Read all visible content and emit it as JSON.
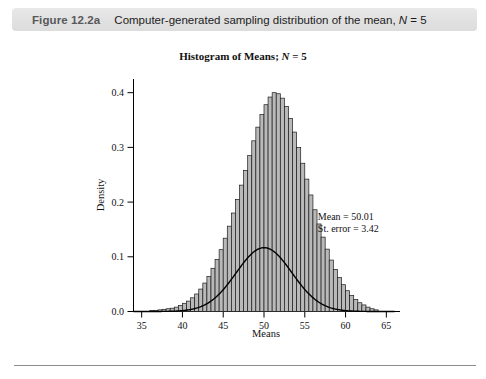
{
  "caption": {
    "label": "Figure 12.2a",
    "text_before_italic": "Computer-generated sampling distribution of the mean, ",
    "italic_symbol": "N",
    "text_after_italic": " = 5",
    "full": "Figure 12.2a   Computer-generated sampling distribution of the mean, N = 5",
    "background_color": "#e2e2e2",
    "label_color": "#58585a"
  },
  "chart_data": {
    "type": "bar",
    "title_prefix": "Histogram of Means; ",
    "title_italic": "N",
    "title_suffix": " = 5",
    "title": "Histogram of Means; N = 5",
    "xlabel": "Means",
    "ylabel": "Density",
    "xlim": [
      34.0,
      66.0
    ],
    "ylim": [
      0.0,
      0.425
    ],
    "xticks": [
      35,
      40,
      45,
      50,
      55,
      60,
      65
    ],
    "xtick_labels": [
      "35",
      "40",
      "45",
      "50",
      "55",
      "60",
      "65"
    ],
    "yticks": [
      0.0,
      0.1,
      0.2,
      0.3,
      0.4
    ],
    "ytick_labels": [
      "0.0",
      "0.1",
      "0.2",
      "0.3",
      "0.4"
    ],
    "grid": false,
    "legend": "none",
    "bar_fill_color": "#b9b9b9",
    "bar_edge_color": "#1a1a1a",
    "curve_color": "#000000",
    "bin_width": 0.5,
    "bin_centers": [
      36.25,
      36.75,
      37.25,
      37.75,
      38.25,
      38.75,
      39.25,
      39.75,
      40.25,
      40.75,
      41.25,
      41.75,
      42.25,
      42.75,
      43.25,
      43.75,
      44.25,
      44.75,
      45.25,
      45.75,
      46.25,
      46.75,
      47.25,
      47.75,
      48.25,
      48.75,
      49.25,
      49.75,
      50.25,
      50.75,
      51.25,
      51.75,
      52.25,
      52.75,
      53.25,
      53.75,
      54.25,
      54.75,
      55.25,
      55.75,
      56.25,
      56.75,
      57.25,
      57.75,
      58.25,
      58.75,
      59.25,
      59.75,
      60.25,
      60.75,
      61.25,
      61.75,
      62.25,
      62.75,
      63.25,
      63.75
    ],
    "values": [
      0.002,
      0.002,
      0.003,
      0.004,
      0.005,
      0.006,
      0.008,
      0.011,
      0.015,
      0.019,
      0.025,
      0.032,
      0.041,
      0.052,
      0.064,
      0.079,
      0.095,
      0.113,
      0.134,
      0.156,
      0.18,
      0.205,
      0.231,
      0.258,
      0.285,
      0.312,
      0.337,
      0.36,
      0.378,
      0.392,
      0.4,
      0.398,
      0.39,
      0.375,
      0.353,
      0.328,
      0.3,
      0.271,
      0.242,
      0.213,
      0.186,
      0.16,
      0.136,
      0.114,
      0.094,
      0.077,
      0.062,
      0.049,
      0.038,
      0.029,
      0.022,
      0.016,
      0.012,
      0.008,
      0.005,
      0.003
    ],
    "overlay_curve": {
      "type": "normal",
      "mean": 50.01,
      "sd": 3.42,
      "peak_density": 0.4
    },
    "annotations": [
      {
        "name": "mean",
        "text": "Mean = 50.01",
        "x": 56.6,
        "y": 0.168
      },
      {
        "name": "standard-error",
        "text": "St. error = 3.42",
        "x": 56.6,
        "y": 0.145
      }
    ]
  }
}
